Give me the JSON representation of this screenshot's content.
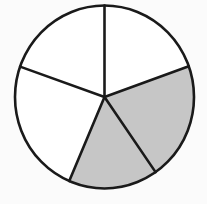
{
  "figure": {
    "name": "circle-divided-into-five-sectors",
    "background_color": "#fbfbfb",
    "stroke_color": "#1a1a1a",
    "shaded_color": "#c6c6c6",
    "unshaded_color": "#ffffff",
    "stroke_width": 2.6
  },
  "chart_data": {
    "type": "pie",
    "title": "",
    "xlabel": "",
    "ylabel": "",
    "legend": [],
    "center": {
      "cx": 104.5,
      "cy": 97.0
    },
    "radius": {
      "rx": 89.5,
      "ry": 91.5
    },
    "boundary_angles_deg": [
      90.0,
      160.6,
      246.8,
      304.8,
      19.6
    ],
    "total_sectors": 5,
    "shaded_count": 2,
    "unshaded_count": 3,
    "categories": [
      "sector-1",
      "sector-2",
      "sector-3",
      "sector-4",
      "sector-5"
    ],
    "values": [
      70.6,
      86.2,
      58.0,
      74.8,
      70.4
    ],
    "sectors": [
      {
        "id": "sector-1",
        "name": "upper-left-sector",
        "start_angle_deg": 90.0,
        "end_angle_deg": 160.6,
        "sweep_deg": 70.6,
        "fill": "#ffffff",
        "shaded": false
      },
      {
        "id": "sector-2",
        "name": "left-sector",
        "start_angle_deg": 160.6,
        "end_angle_deg": 246.8,
        "sweep_deg": 86.2,
        "fill": "#ffffff",
        "shaded": false
      },
      {
        "id": "sector-3",
        "name": "lower-middle-shaded-sector",
        "start_angle_deg": 246.8,
        "end_angle_deg": 304.8,
        "sweep_deg": 58.0,
        "fill": "#c6c6c6",
        "shaded": true
      },
      {
        "id": "sector-4",
        "name": "right-shaded-sector",
        "start_angle_deg": 304.8,
        "end_angle_deg": 379.6,
        "sweep_deg": 74.8,
        "fill": "#c6c6c6",
        "shaded": true
      },
      {
        "id": "sector-5",
        "name": "upper-right-sector",
        "start_angle_deg": 19.6,
        "end_angle_deg": 90.0,
        "sweep_deg": 70.4,
        "fill": "#ffffff",
        "shaded": false
      }
    ]
  }
}
